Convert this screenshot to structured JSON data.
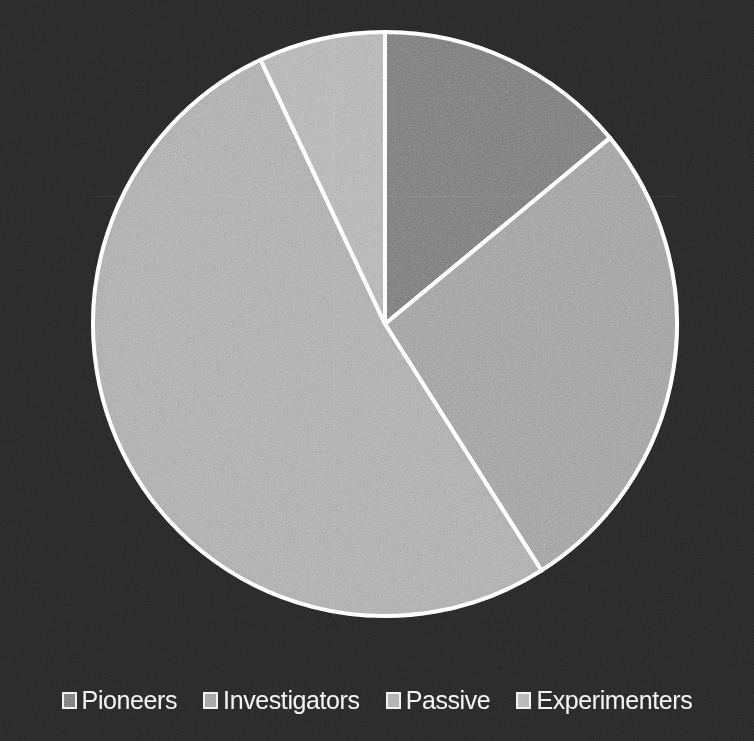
{
  "background_color": "#282828",
  "slice_border_color": "#ffffff",
  "legend": {
    "items": [
      {
        "label": "Pioneers",
        "color": "#787878"
      },
      {
        "label": "Investigators",
        "color": "#9e9e9e"
      },
      {
        "label": "Passive",
        "color": "#aaaaaa"
      },
      {
        "label": "Experimenters",
        "color": "#b2b2b2"
      }
    ]
  },
  "chart_data": {
    "type": "pie",
    "title": "",
    "subtitle": "",
    "xlabel": "",
    "ylabel": "",
    "grid": false,
    "legend_position": "bottom",
    "start_angle_deg": 0,
    "direction": "clockwise",
    "center": {
      "x": 385,
      "y": 324
    },
    "radius": 292,
    "categories": [
      "Pioneers",
      "Investigators",
      "Passive",
      "Experimenters"
    ],
    "values": [
      14,
      27,
      52,
      7
    ],
    "value_unit": "percent",
    "slice_colors": [
      "#787878",
      "#9e9e9e",
      "#aaaaaa",
      "#b2b2b2"
    ],
    "slices": [
      {
        "label": "Pioneers",
        "value": 14,
        "start_deg": 0,
        "end_deg": 50.4,
        "color": "#787878"
      },
      {
        "label": "Investigators",
        "value": 27,
        "start_deg": 50.4,
        "end_deg": 147.6,
        "color": "#9e9e9e"
      },
      {
        "label": "Passive",
        "value": 52,
        "start_deg": 147.6,
        "end_deg": 334.8,
        "color": "#aaaaaa"
      },
      {
        "label": "Experimenters",
        "value": 7,
        "start_deg": 334.8,
        "end_deg": 360,
        "color": "#b2b2b2"
      }
    ]
  }
}
